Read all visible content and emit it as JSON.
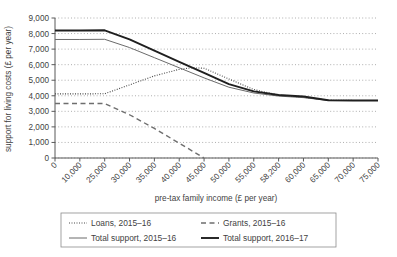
{
  "chart_data": {
    "type": "line",
    "title": "",
    "xlabel": "pre-tax family income (£ per year)",
    "ylabel": "support for living costs (£ per year)",
    "xlim": [
      0,
      75000
    ],
    "ylim": [
      0,
      9000
    ],
    "grid": true,
    "legend_position": "bottom",
    "xticks": [
      0,
      10000,
      25000,
      30000,
      35000,
      40000,
      45000,
      50000,
      55000,
      58200,
      60000,
      65000,
      70000,
      75000
    ],
    "xtick_labels": [
      "0",
      "10,000",
      "25,000",
      "30,000",
      "35,000",
      "40,000",
      "45,000",
      "50,000",
      "55,000",
      "58,200",
      "60,000",
      "65,000",
      "70,000",
      "75,000"
    ],
    "yticks": [
      0,
      1000,
      2000,
      3000,
      4000,
      5000,
      6000,
      7000,
      8000,
      9000
    ],
    "ytick_labels": [
      "0",
      "1,000",
      "2,000",
      "3,000",
      "4,000",
      "5,000",
      "6,000",
      "7,000",
      "8,000",
      "9,000"
    ],
    "series": [
      {
        "name": "Loans, 2015–16",
        "style": "dotted",
        "color": "#4a4a4a",
        "x": [
          0,
          10000,
          25000,
          30000,
          35000,
          40000,
          42500,
          45000,
          50000,
          55000,
          58200,
          60000,
          65000,
          70000,
          75000
        ],
        "values": [
          4120,
          4120,
          4130,
          4700,
          5280,
          5700,
          5800,
          5770,
          5080,
          4400,
          4050,
          3900,
          3720,
          3700,
          3700
        ]
      },
      {
        "name": "Grants, 2015–16",
        "style": "dashed",
        "color": "#6e6e6e",
        "x": [
          0,
          10000,
          25000,
          30000,
          35000,
          40000,
          45000
        ],
        "values": [
          3500,
          3500,
          3500,
          2780,
          1900,
          950,
          0
        ]
      },
      {
        "name": "Total support, 2015–16",
        "style": "solid-thin",
        "color": "#6b6b6b",
        "x": [
          0,
          10000,
          25000,
          30000,
          35000,
          40000,
          45000,
          50000,
          55000,
          58200,
          60000,
          65000,
          70000,
          75000
        ],
        "values": [
          7620,
          7620,
          7630,
          7100,
          6450,
          5800,
          5150,
          4550,
          4180,
          3980,
          3880,
          3700,
          3700,
          3700
        ]
      },
      {
        "name": "Total support, 2016–17",
        "style": "solid-thick",
        "color": "#1f1f1f",
        "x": [
          0,
          10000,
          25000,
          30000,
          35000,
          40000,
          45000,
          50000,
          55000,
          58200,
          60000,
          65000,
          70000,
          75000
        ],
        "values": [
          8200,
          8200,
          8210,
          7620,
          6900,
          6180,
          5480,
          4750,
          4280,
          4050,
          3950,
          3710,
          3700,
          3700
        ]
      }
    ]
  },
  "legend": {
    "items": [
      {
        "label": "Loans, 2015–16"
      },
      {
        "label": "Grants, 2015–16"
      },
      {
        "label": "Total support, 2015–16"
      },
      {
        "label": "Total support, 2016–17"
      }
    ]
  },
  "colors": {
    "loans": "#4a4a4a",
    "grants": "#6e6e6e",
    "total_2015": "#6b6b6b",
    "total_2016": "#1f1f1f",
    "grid": "#9a9a9a",
    "axis": "#595959",
    "text": "#3f3f3f"
  }
}
